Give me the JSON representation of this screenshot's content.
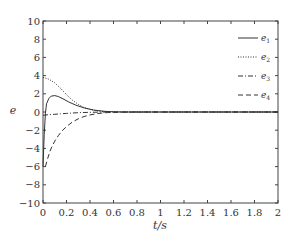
{
  "chart_data": {
    "type": "line",
    "title": "",
    "xlabel": "t/s",
    "ylabel": "e",
    "xlim": [
      0,
      2
    ],
    "ylim": [
      -10,
      10
    ],
    "x_ticks": [
      0,
      0.2,
      0.4,
      0.6,
      0.8,
      1,
      1.2,
      1.4,
      1.6,
      1.8,
      2
    ],
    "x_tick_labels": [
      "0",
      "0.2",
      "0.4",
      "0.6",
      "0.8",
      "1",
      "1.2",
      "1.4",
      "1.6",
      "1.8",
      "2"
    ],
    "y_ticks": [
      10,
      8,
      6,
      4,
      2,
      0,
      -2,
      -4,
      -6,
      -8,
      -10
    ],
    "y_tick_labels": [
      "10",
      "8",
      "6",
      "4",
      "2",
      "0",
      "−2",
      "−4",
      "−6",
      "−8",
      "−10"
    ],
    "grid": false,
    "legend_position": "upper right",
    "series": [
      {
        "name": "e1",
        "label_base": "e",
        "label_sub": "1",
        "style": "solid",
        "x": [
          0,
          0.01,
          0.02,
          0.03,
          0.05,
          0.07,
          0.1,
          0.13,
          0.17,
          0.22,
          0.28,
          0.35,
          0.43,
          0.52,
          0.6,
          0.7,
          1.0,
          1.5,
          2.0
        ],
        "values": [
          -6,
          -2.5,
          -0.2,
          0.9,
          1.5,
          1.75,
          1.8,
          1.7,
          1.45,
          1.1,
          0.75,
          0.45,
          0.22,
          0.08,
          0.02,
          0,
          0,
          0,
          0
        ]
      },
      {
        "name": "e2",
        "label_base": "e",
        "label_sub": "2",
        "style": "dotted",
        "x": [
          0,
          0.05,
          0.1,
          0.15,
          0.2,
          0.25,
          0.3,
          0.35,
          0.4,
          0.45,
          0.5,
          0.55,
          0.6,
          0.7,
          1.0,
          1.5,
          2.0
        ],
        "values": [
          3.8,
          3.6,
          3.2,
          2.6,
          1.9,
          1.3,
          0.85,
          0.5,
          0.28,
          0.15,
          0.07,
          0.03,
          0.01,
          0,
          0,
          0,
          0
        ]
      },
      {
        "name": "e3",
        "label_base": "e",
        "label_sub": "3",
        "style": "dashdot",
        "x": [
          0,
          0.05,
          0.1,
          0.15,
          0.2,
          0.25,
          0.3,
          0.35,
          0.4,
          0.5,
          0.6,
          1.0,
          1.5,
          2.0
        ],
        "values": [
          -0.35,
          -0.3,
          -0.25,
          -0.2,
          -0.15,
          -0.11,
          -0.08,
          -0.05,
          -0.03,
          -0.01,
          0,
          0,
          0,
          0
        ],
        "note": "dash-dot line near zero"
      },
      {
        "name": "e4",
        "label_base": "e",
        "label_sub": "4",
        "style": "dashed",
        "x": [
          0.02,
          0.04,
          0.06,
          0.08,
          0.1,
          0.13,
          0.16,
          0.2,
          0.25,
          0.3,
          0.35,
          0.4,
          0.45,
          0.5,
          0.55,
          0.6,
          0.7,
          1.0,
          1.5,
          2.0
        ],
        "values": [
          -6,
          -5.1,
          -4.3,
          -3.7,
          -3.2,
          -2.6,
          -2.1,
          -1.6,
          -1.1,
          -0.75,
          -0.5,
          -0.32,
          -0.2,
          -0.12,
          -0.07,
          -0.04,
          -0.01,
          0,
          0,
          0
        ]
      }
    ]
  }
}
